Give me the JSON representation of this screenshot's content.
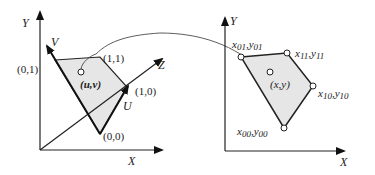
{
  "figure": {
    "fill_color": "#e6e6e6",
    "stroke_color": "#222222",
    "left": {
      "axes": {
        "y_label": "Y",
        "x_label": "X",
        "z_label": "Z"
      },
      "vectors": {
        "u_label": "U",
        "v_label": "V"
      },
      "corners": {
        "c00": "(0,0)",
        "c10": "(1,0)",
        "c11": "(1,1)",
        "c01": "(0,1)"
      },
      "point_label": "(u,v)"
    },
    "right": {
      "axes": {
        "y_label": "Y",
        "x_label": "X"
      },
      "corners": {
        "c01": {
          "x": "x",
          "xs": "01",
          "y": "y",
          "ys": "01"
        },
        "c11": {
          "x": "x",
          "xs": "11",
          "y": "y",
          "ys": "11"
        },
        "c10": {
          "x": "x",
          "xs": "10",
          "y": "y",
          "ys": "10"
        },
        "c00": {
          "x": "x",
          "xs": "00",
          "y": "y",
          "ys": "00"
        }
      },
      "point_label": "(x,y)",
      "separator": ","
    }
  }
}
